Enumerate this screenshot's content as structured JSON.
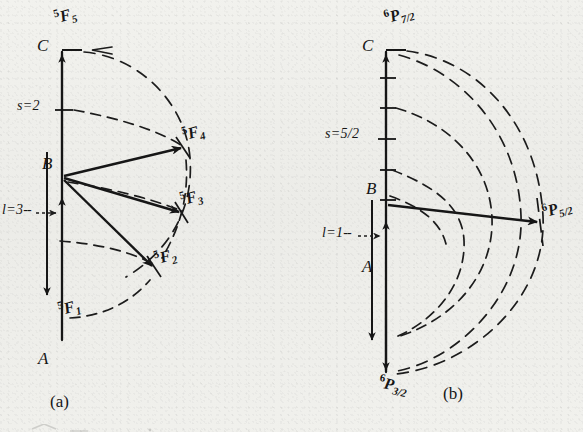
{
  "figure": {
    "kind": "vector-coupling-diagram",
    "panels": [
      {
        "id": "a",
        "caption": "(a)",
        "axis_points": {
          "top": "C",
          "middle": "B",
          "bottom": "A"
        },
        "quantum_numbers": {
          "spin": {
            "symbol": "s",
            "equals": "=",
            "value": "2",
            "label": "s = 2"
          },
          "orbital": {
            "symbol": "l",
            "equals": "=",
            "value": "3",
            "label": "l = 3",
            "leader": "--"
          }
        },
        "terms": [
          {
            "id": "5F5",
            "pre": "5",
            "letter": "F",
            "sub": "5",
            "j": 5
          },
          {
            "id": "5F4",
            "pre": "5",
            "letter": "F",
            "sub": "4",
            "j": 4
          },
          {
            "id": "5F3",
            "pre": "5",
            "letter": "F",
            "sub": "3",
            "j": 3
          },
          {
            "id": "5F2",
            "pre": "5",
            "letter": "F",
            "sub": "2",
            "j": 2
          },
          {
            "id": "5F1",
            "pre": "5",
            "letter": "F",
            "sub": "1",
            "j": 1
          }
        ]
      },
      {
        "id": "b",
        "caption": "(b)",
        "axis_points": {
          "top": "C",
          "middle": "B",
          "bottom": "A"
        },
        "quantum_numbers": {
          "spin": {
            "symbol": "s",
            "equals": "=",
            "numerator": "5",
            "denominator": "2",
            "label": "s = 5/2"
          },
          "orbital": {
            "symbol": "l",
            "equals": "=",
            "value": "1",
            "label": "l = 1",
            "leader": "--"
          }
        },
        "terms": [
          {
            "id": "6P7h",
            "pre": "6",
            "letter": "P",
            "numerator": "7",
            "denominator": "2",
            "j": 3.5
          },
          {
            "id": "6P5h",
            "pre": "6",
            "letter": "P",
            "numerator": "5",
            "denominator": "2",
            "j": 2.5
          },
          {
            "id": "6P3h",
            "pre": "6",
            "letter": "P",
            "numerator": "3",
            "denominator": "2",
            "j": 1.5
          }
        ]
      }
    ],
    "colors": {
      "ink": "#161616",
      "paper": "#f0f0ec",
      "dash": "#1c1c1c"
    }
  }
}
